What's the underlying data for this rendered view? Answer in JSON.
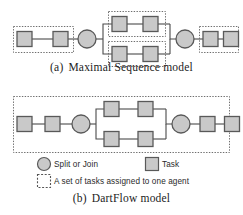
{
  "figure": {
    "panels": [
      {
        "id": "panel-a",
        "caption_tag": "(a)",
        "caption_text": "Maximal Sequence model",
        "description": "Maximal Sequence model workflow diagram",
        "agent_groups": 4,
        "tasks": 8,
        "split_join_nodes": 2
      },
      {
        "id": "panel-b",
        "caption_tag": "(b)",
        "caption_text": "DartFlow model",
        "description": "DartFlow model workflow diagram",
        "agent_groups": 1,
        "tasks": 8,
        "split_join_nodes": 2
      }
    ]
  },
  "legend": {
    "items": [
      {
        "symbol": "circle",
        "label": "Split or Join"
      },
      {
        "symbol": "square",
        "label": "Task"
      },
      {
        "symbol": "dotted-box",
        "label": "A set of tasks assigned to one agent"
      }
    ]
  },
  "colors": {
    "shape_fill": "#c9c9c9",
    "shape_stroke": "#595959",
    "edge": "#4a4a4a",
    "dotted_box": "#6e6e6e",
    "background": "#ffffff",
    "text": "#1b1b1b"
  }
}
